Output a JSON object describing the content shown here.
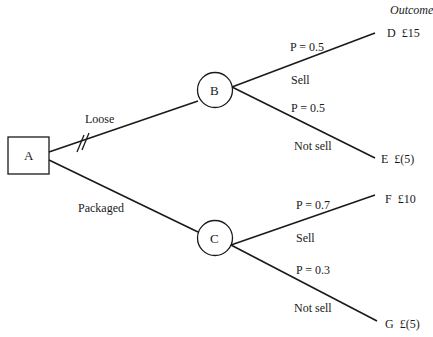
{
  "header": {
    "outcome_label": "Outcome"
  },
  "nodes": {
    "A": {
      "label": "A",
      "type": "decision"
    },
    "B": {
      "label": "B",
      "type": "chance"
    },
    "C": {
      "label": "C",
      "type": "chance"
    }
  },
  "branches": {
    "loose": {
      "label": "Loose",
      "rejected": true
    },
    "packaged": {
      "label": "Packaged"
    },
    "b_sell": {
      "label": "Sell",
      "probability": "P = 0.5"
    },
    "b_not_sell": {
      "label": "Not sell",
      "probability": "P = 0.5"
    },
    "c_sell": {
      "label": "Sell",
      "probability": "P = 0.7"
    },
    "c_not_sell": {
      "label": "Not sell",
      "probability": "P = 0.3"
    }
  },
  "outcomes": [
    {
      "id": "D",
      "value": "£15"
    },
    {
      "id": "E",
      "value": "£(5)"
    },
    {
      "id": "F",
      "value": "£10"
    },
    {
      "id": "G",
      "value": "£(5)"
    }
  ]
}
